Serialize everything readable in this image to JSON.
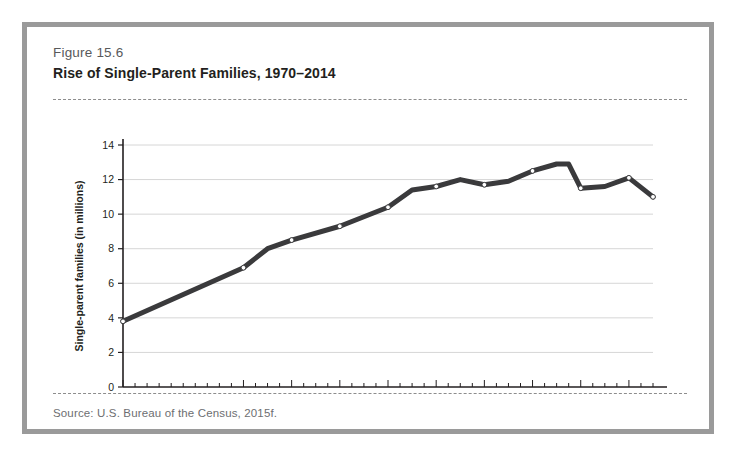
{
  "figure": {
    "number": "Figure 15.6",
    "title": "Rise of Single-Parent Families, 1970–2014",
    "source": "Source: U.S. Bureau of the Census, 2015f."
  },
  "colors": {
    "frame": "#9a9a9a",
    "line": "#3a3a3c",
    "marker_fill": "#ffffff",
    "grid": "#d6d6d6",
    "axis": "#231f20",
    "text_muted": "#6d6e71"
  },
  "chart_data": {
    "type": "line",
    "title": "Rise of Single-Parent Families, 1970–2014",
    "xlabel": "",
    "ylabel": "Single-parent families (in millions)",
    "xlim": [
      1970,
      2014
    ],
    "ylim": [
      0,
      14
    ],
    "yticks": [
      0,
      2,
      4,
      6,
      8,
      10,
      12,
      14
    ],
    "ytick_labels": [
      "0",
      "2",
      "4",
      "6",
      "8",
      "10",
      "12",
      "14"
    ],
    "xticks": [
      1970,
      1980,
      1984,
      1988,
      1992,
      1996,
      2000,
      2004,
      2008,
      2012
    ],
    "xtick_labels": [
      "1970",
      "1980",
      "1984",
      "1988",
      "1992",
      "1996",
      "2000",
      "2004",
      "2008",
      "2012"
    ],
    "x_minor_tick_step": 1,
    "grid": "horizontal",
    "legend": "none",
    "series": [
      {
        "name": "Single-parent families",
        "x": [
          1970,
          1980,
          1982,
          1984,
          1988,
          1992,
          1994,
          1996,
          1998,
          2000,
          2002,
          2004,
          2006,
          2007,
          2008,
          2010,
          2012,
          2014
        ],
        "values": [
          3.8,
          6.9,
          8.0,
          8.5,
          9.3,
          10.4,
          11.4,
          11.6,
          12.0,
          11.7,
          11.9,
          12.5,
          12.9,
          12.9,
          11.5,
          11.6,
          12.1,
          11.0
        ],
        "markers": [
          1970,
          1980,
          1984,
          1988,
          1992,
          1996,
          2000,
          2004,
          2008,
          2012,
          2014
        ]
      }
    ]
  }
}
